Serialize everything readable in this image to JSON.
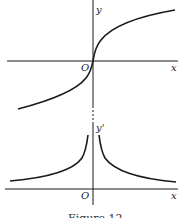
{
  "figure": {
    "caption": "Figure 12",
    "ink_color": "#1a1a1a",
    "background": "#ffffff"
  },
  "top_plot": {
    "y_label": "y",
    "x_label": "x",
    "origin_label": "O",
    "description": "cube-root-like curve y = x^(1/3), vertical tangent at origin"
  },
  "bottom_plot": {
    "y_label": "y'",
    "x_label": "x",
    "origin_label": "O",
    "description": "derivative y' = 1/(3x^(2/3)), two branches asymptotic to y'-axis"
  }
}
